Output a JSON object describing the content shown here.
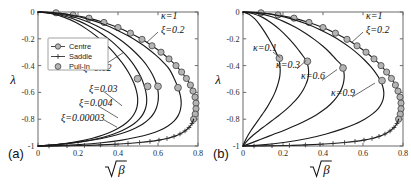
{
  "figure": {
    "caption_tags": {
      "panel_a": "(a)",
      "panel_b": "(b)"
    },
    "axis": {
      "xlabel": "√β",
      "ylabel": "λ",
      "xticks": [
        "0",
        "0.2",
        "0.4",
        "0.6",
        "0.8"
      ],
      "yticks": [
        "0",
        "-0.2",
        "-0.4",
        "-0.6",
        "-0.8",
        "-1"
      ],
      "xlim": [
        0,
        0.8
      ],
      "ylim": [
        -1,
        0
      ]
    },
    "legend": {
      "position": "upper-left-panel-a",
      "items": [
        {
          "label": "Centre",
          "marker": "circle-on-line"
        },
        {
          "label": "Saddle",
          "marker": "cross-on-line"
        },
        {
          "label": "Pull-In",
          "marker": "circle"
        }
      ]
    },
    "colors": {
      "curve": "#1a1a1a",
      "marker_fill": "#b4b4b4",
      "marker_edge": "#4a4a4a",
      "frame": "#6a6a6a",
      "background": "#ffffff"
    }
  },
  "chart_data": [
    {
      "id": "panel-a",
      "type": "line",
      "title": "",
      "xlabel": "√β",
      "ylabel": "λ",
      "xlim": [
        0,
        0.8
      ],
      "ylim": [
        -1,
        0
      ],
      "grid": false,
      "legend": [
        "Centre",
        "Saddle",
        "Pull-In"
      ],
      "panel_label": "(a)",
      "fixed_params": [
        "κ=1"
      ],
      "annotations": [
        {
          "text": "κ=1",
          "x": 0.615,
          "y": -0.055
        },
        {
          "text": "ξ=0.2",
          "x": 0.615,
          "y": -0.155
        },
        {
          "text": "ξ=0.12",
          "x": 0.225,
          "y": -0.44
        },
        {
          "text": "ξ=0.03",
          "x": 0.255,
          "y": -0.6
        },
        {
          "text": "ξ=0.004",
          "x": 0.205,
          "y": -0.705
        },
        {
          "text": "ξ=0.00003",
          "x": 0.115,
          "y": -0.81
        }
      ],
      "series": [
        {
          "name": "ξ=0.2 centre",
          "branch": "centre",
          "marker": "circle",
          "x": [
            0.0,
            0.09,
            0.175,
            0.255,
            0.33,
            0.4,
            0.462,
            0.52,
            0.57,
            0.615,
            0.655,
            0.69,
            0.718,
            0.742,
            0.762,
            0.775,
            0.785,
            0.79,
            0.79,
            0.786,
            0.778
          ],
          "y": [
            0.0,
            -0.006,
            -0.022,
            -0.046,
            -0.078,
            -0.116,
            -0.158,
            -0.204,
            -0.252,
            -0.3,
            -0.35,
            -0.4,
            -0.448,
            -0.496,
            -0.545,
            -0.59,
            -0.635,
            -0.68,
            -0.722,
            -0.762,
            -0.8
          ]
        },
        {
          "name": "ξ=0.2 saddle",
          "branch": "saddle",
          "marker": "cross",
          "x": [
            0.778,
            0.77,
            0.755,
            0.735,
            0.71,
            0.68,
            0.645,
            0.605,
            0.56,
            0.508,
            0.45,
            0.385,
            0.312,
            0.232,
            0.145,
            0.055,
            0.0
          ],
          "y": [
            -0.8,
            -0.832,
            -0.862,
            -0.888,
            -0.91,
            -0.928,
            -0.944,
            -0.956,
            -0.966,
            -0.974,
            -0.981,
            -0.987,
            -0.992,
            -0.996,
            -0.998,
            -1.0,
            -1.0
          ]
        },
        {
          "name": "ξ=0.12",
          "branch": "centre",
          "marker": "none",
          "pull_in": {
            "x": 0.7,
            "y": -0.565
          },
          "x": [
            0.0,
            0.09,
            0.172,
            0.25,
            0.322,
            0.388,
            0.448,
            0.502,
            0.55,
            0.592,
            0.628,
            0.658,
            0.682,
            0.7,
            0.712,
            0.716,
            0.712,
            0.7,
            0.68,
            0.65,
            0.61,
            0.558,
            0.492,
            0.412,
            0.318,
            0.21,
            0.095,
            0.0
          ],
          "y": [
            0.0,
            -0.007,
            -0.025,
            -0.053,
            -0.088,
            -0.13,
            -0.176,
            -0.224,
            -0.274,
            -0.326,
            -0.378,
            -0.43,
            -0.5,
            -0.565,
            -0.625,
            -0.68,
            -0.73,
            -0.775,
            -0.815,
            -0.85,
            -0.882,
            -0.91,
            -0.935,
            -0.958,
            -0.976,
            -0.989,
            -0.997,
            -1.0
          ]
        },
        {
          "name": "ξ=0.03",
          "branch": "centre",
          "marker": "none",
          "pull_in": {
            "x": 0.6,
            "y": -0.555
          },
          "x": [
            0.0,
            0.082,
            0.158,
            0.228,
            0.292,
            0.35,
            0.402,
            0.448,
            0.488,
            0.522,
            0.55,
            0.572,
            0.588,
            0.598,
            0.602,
            0.6,
            0.592,
            0.578,
            0.556,
            0.526,
            0.488,
            0.44,
            0.382,
            0.312,
            0.23,
            0.138,
            0.05,
            0.0
          ],
          "y": [
            0.0,
            -0.009,
            -0.03,
            -0.062,
            -0.102,
            -0.148,
            -0.198,
            -0.25,
            -0.304,
            -0.358,
            -0.412,
            -0.466,
            -0.52,
            -0.572,
            -0.622,
            -0.67,
            -0.716,
            -0.758,
            -0.798,
            -0.834,
            -0.866,
            -0.896,
            -0.922,
            -0.946,
            -0.966,
            -0.983,
            -0.995,
            -1.0
          ]
        },
        {
          "name": "ξ=0.004",
          "branch": "centre",
          "marker": "none",
          "pull_in": {
            "x": 0.548,
            "y": -0.555
          },
          "x": [
            0.0,
            0.075,
            0.145,
            0.208,
            0.266,
            0.318,
            0.364,
            0.404,
            0.44,
            0.47,
            0.494,
            0.514,
            0.528,
            0.538,
            0.543,
            0.543,
            0.537,
            0.525,
            0.506,
            0.48,
            0.446,
            0.404,
            0.352,
            0.29,
            0.216,
            0.132,
            0.048,
            0.0
          ],
          "y": [
            0.0,
            -0.011,
            -0.035,
            -0.07,
            -0.113,
            -0.162,
            -0.214,
            -0.268,
            -0.322,
            -0.376,
            -0.43,
            -0.484,
            -0.536,
            -0.586,
            -0.634,
            -0.68,
            -0.722,
            -0.762,
            -0.8,
            -0.834,
            -0.866,
            -0.896,
            -0.924,
            -0.948,
            -0.968,
            -0.984,
            -0.995,
            -1.0
          ]
        },
        {
          "name": "ξ=0.00003",
          "branch": "centre",
          "marker": "none",
          "pull_in": {
            "x": 0.498,
            "y": -0.498
          },
          "x": [
            0.0,
            0.068,
            0.132,
            0.19,
            0.242,
            0.29,
            0.332,
            0.37,
            0.402,
            0.43,
            0.452,
            0.47,
            0.484,
            0.493,
            0.498,
            0.498,
            0.493,
            0.482,
            0.465,
            0.441,
            0.41,
            0.372,
            0.325,
            0.268,
            0.202,
            0.126,
            0.046,
            0.0
          ],
          "y": [
            0.0,
            -0.013,
            -0.04,
            -0.079,
            -0.126,
            -0.178,
            -0.232,
            -0.288,
            -0.344,
            -0.398,
            -0.45,
            -0.5,
            -0.548,
            -0.594,
            -0.638,
            -0.68,
            -0.72,
            -0.758,
            -0.794,
            -0.828,
            -0.86,
            -0.89,
            -0.918,
            -0.944,
            -0.966,
            -0.983,
            -0.995,
            -1.0
          ]
        }
      ],
      "pull_in_points": [
        {
          "x": 0.7,
          "y": -0.565,
          "label": "ξ=0.12"
        },
        {
          "x": 0.6,
          "y": -0.555,
          "label": "ξ=0.03"
        },
        {
          "x": 0.548,
          "y": -0.555,
          "label": "ξ=0.004"
        },
        {
          "x": 0.498,
          "y": -0.498,
          "label": "ξ=0.00003"
        }
      ]
    },
    {
      "id": "panel-b",
      "type": "line",
      "title": "",
      "xlabel": "√β",
      "ylabel": "λ",
      "xlim": [
        0,
        0.8
      ],
      "ylim": [
        -1,
        0
      ],
      "grid": false,
      "legend": [],
      "panel_label": "(b)",
      "fixed_params": [
        "ξ=0.2"
      ],
      "annotations": [
        {
          "text": "κ=1",
          "x": 0.615,
          "y": -0.055
        },
        {
          "text": "ξ=0.2",
          "x": 0.615,
          "y": -0.155
        },
        {
          "text": "κ=0.1",
          "x": 0.05,
          "y": -0.29
        },
        {
          "text": "κ=0.3",
          "x": 0.165,
          "y": -0.415
        },
        {
          "text": "κ=0.6",
          "x": 0.29,
          "y": -0.5
        },
        {
          "text": "κ=0.9",
          "x": 0.44,
          "y": -0.625
        }
      ],
      "series": [
        {
          "name": "κ=1 centre",
          "branch": "centre",
          "marker": "circle",
          "x": [
            0.0,
            0.09,
            0.175,
            0.255,
            0.33,
            0.4,
            0.462,
            0.52,
            0.57,
            0.615,
            0.655,
            0.69,
            0.718,
            0.742,
            0.762,
            0.775,
            0.785,
            0.79,
            0.79,
            0.786,
            0.778
          ],
          "y": [
            0.0,
            -0.006,
            -0.022,
            -0.046,
            -0.078,
            -0.116,
            -0.158,
            -0.204,
            -0.252,
            -0.3,
            -0.35,
            -0.4,
            -0.448,
            -0.496,
            -0.545,
            -0.59,
            -0.635,
            -0.68,
            -0.722,
            -0.762,
            -0.8
          ]
        },
        {
          "name": "κ=1 saddle",
          "branch": "saddle",
          "marker": "cross",
          "x": [
            0.778,
            0.77,
            0.755,
            0.735,
            0.71,
            0.68,
            0.645,
            0.605,
            0.56,
            0.508,
            0.45,
            0.385,
            0.312,
            0.232,
            0.145,
            0.055,
            0.0
          ],
          "y": [
            -0.8,
            -0.832,
            -0.862,
            -0.888,
            -0.91,
            -0.928,
            -0.944,
            -0.956,
            -0.966,
            -0.974,
            -0.981,
            -0.987,
            -0.992,
            -0.996,
            -0.998,
            -1.0,
            -1.0
          ]
        },
        {
          "name": "κ=0.9",
          "branch": "centre",
          "marker": "none",
          "pull_in": {
            "x": 0.695,
            "y": -0.512
          },
          "x": [
            0.0,
            0.088,
            0.17,
            0.246,
            0.316,
            0.38,
            0.438,
            0.49,
            0.536,
            0.576,
            0.61,
            0.64,
            0.665,
            0.685,
            0.698,
            0.704,
            0.702,
            0.692,
            0.674,
            0.646,
            0.608,
            0.558,
            0.494,
            0.416,
            0.322,
            0.212,
            0.096,
            0.0
          ],
          "y": [
            0.0,
            -0.007,
            -0.025,
            -0.053,
            -0.088,
            -0.128,
            -0.172,
            -0.218,
            -0.266,
            -0.314,
            -0.362,
            -0.41,
            -0.458,
            -0.506,
            -0.552,
            -0.598,
            -0.642,
            -0.684,
            -0.724,
            -0.762,
            -0.8,
            -0.838,
            -0.874,
            -0.91,
            -0.944,
            -0.972,
            -0.992,
            -1.0
          ]
        },
        {
          "name": "κ=0.6",
          "branch": "centre",
          "marker": "none",
          "pull_in": {
            "x": 0.5,
            "y": -0.418
          },
          "x": [
            0.0,
            0.072,
            0.14,
            0.202,
            0.26,
            0.312,
            0.358,
            0.4,
            0.436,
            0.466,
            0.488,
            0.5,
            0.506,
            0.504,
            0.496,
            0.482,
            0.462,
            0.436,
            0.404,
            0.366,
            0.32,
            0.268,
            0.21,
            0.148,
            0.086,
            0.03,
            0.0
          ],
          "y": [
            0.0,
            -0.01,
            -0.034,
            -0.07,
            -0.112,
            -0.158,
            -0.206,
            -0.256,
            -0.306,
            -0.356,
            -0.388,
            -0.418,
            -0.468,
            -0.516,
            -0.562,
            -0.606,
            -0.648,
            -0.69,
            -0.73,
            -0.768,
            -0.806,
            -0.844,
            -0.88,
            -0.916,
            -0.952,
            -0.984,
            -1.0
          ]
        },
        {
          "name": "κ=0.3",
          "branch": "centre",
          "marker": "none",
          "pull_in": {
            "x": 0.322,
            "y": -0.368
          },
          "x": [
            0.0,
            0.052,
            0.1,
            0.144,
            0.184,
            0.22,
            0.252,
            0.28,
            0.302,
            0.318,
            0.326,
            0.328,
            0.324,
            0.314,
            0.3,
            0.282,
            0.26,
            0.234,
            0.206,
            0.176,
            0.144,
            0.112,
            0.08,
            0.05,
            0.022,
            0.0
          ],
          "y": [
            0.0,
            -0.013,
            -0.042,
            -0.084,
            -0.132,
            -0.184,
            -0.236,
            -0.288,
            -0.332,
            -0.368,
            -0.412,
            -0.456,
            -0.5,
            -0.542,
            -0.584,
            -0.624,
            -0.664,
            -0.702,
            -0.74,
            -0.776,
            -0.812,
            -0.848,
            -0.884,
            -0.92,
            -0.96,
            -1.0
          ]
        },
        {
          "name": "κ=0.1",
          "branch": "centre",
          "marker": "none",
          "pull_in": {
            "x": 0.182,
            "y": -0.345
          },
          "x": [
            0.0,
            0.03,
            0.058,
            0.084,
            0.108,
            0.13,
            0.15,
            0.166,
            0.178,
            0.184,
            0.186,
            0.184,
            0.178,
            0.17,
            0.16,
            0.148,
            0.134,
            0.12,
            0.104,
            0.088,
            0.072,
            0.056,
            0.04,
            0.026,
            0.012,
            0.0
          ],
          "y": [
            0.0,
            -0.016,
            -0.05,
            -0.096,
            -0.148,
            -0.202,
            -0.256,
            -0.304,
            -0.345,
            -0.39,
            -0.434,
            -0.478,
            -0.52,
            -0.56,
            -0.6,
            -0.638,
            -0.676,
            -0.712,
            -0.748,
            -0.782,
            -0.816,
            -0.85,
            -0.884,
            -0.918,
            -0.958,
            -1.0
          ]
        }
      ],
      "pull_in_points": [
        {
          "x": 0.182,
          "y": -0.345,
          "label": "κ=0.1"
        },
        {
          "x": 0.322,
          "y": -0.368,
          "label": "κ=0.3"
        },
        {
          "x": 0.5,
          "y": -0.418,
          "label": "κ=0.6"
        },
        {
          "x": 0.695,
          "y": -0.512,
          "label": "κ=0.9"
        }
      ]
    }
  ]
}
